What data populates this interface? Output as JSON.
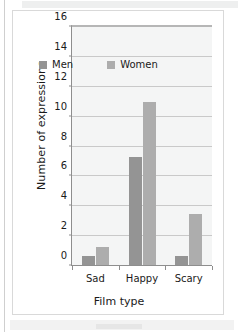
{
  "chart_data": {
    "type": "bar",
    "title": "",
    "xlabel": "Film type",
    "ylabel": "Number of expressions",
    "categories": [
      "Sad",
      "Happy",
      "Scary"
    ],
    "series": [
      {
        "name": "Men",
        "values": [
          0.65,
          7.3,
          0.7
        ]
      },
      {
        "name": "Women",
        "values": [
          1.3,
          11.0,
          3.5
        ]
      }
    ],
    "ylim": [
      0,
      16
    ],
    "ytick_labels": [
      "0",
      "2",
      "4",
      "6",
      "8",
      "10",
      "12",
      "14",
      "16"
    ],
    "ytick_values": [
      0,
      2,
      4,
      6,
      8,
      10,
      12,
      14,
      16
    ],
    "grid": true,
    "legend_position": "inside-top",
    "colors": {
      "men": "#949494",
      "women": "#adadad",
      "plot_background": "#f4f5f5",
      "gridline": "#c9c9c9",
      "axis": "#8e8e8e",
      "text": "#1a1a1a",
      "card_background": "#ffffff",
      "card_border": "#d9d9d9"
    }
  }
}
